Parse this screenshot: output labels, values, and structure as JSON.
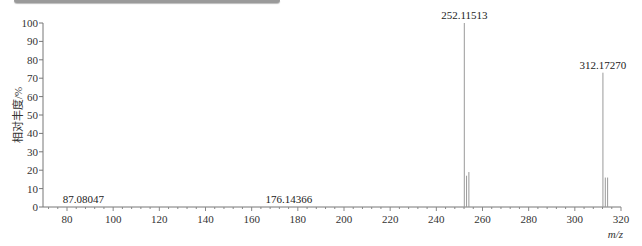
{
  "chart_data": {
    "type": "bar",
    "title": "",
    "xlabel": "m/z",
    "ylabel": "相对丰度/%",
    "xlim": [
      70,
      320
    ],
    "ylim": [
      0,
      100
    ],
    "x_ticks": [
      80,
      100,
      120,
      140,
      160,
      180,
      200,
      220,
      240,
      260,
      280,
      300,
      320
    ],
    "y_ticks": [
      0,
      10,
      20,
      30,
      40,
      50,
      60,
      70,
      80,
      90,
      100
    ],
    "grid": false,
    "peaks": [
      {
        "mz": 87.08047,
        "intensity": 0.3,
        "label": "87.08047"
      },
      {
        "mz": 176.14366,
        "intensity": 0.3,
        "label": "176.14366"
      },
      {
        "mz": 252.11513,
        "intensity": 100,
        "label": "252.11513"
      },
      {
        "mz": 253.1,
        "intensity": 17,
        "label": ""
      },
      {
        "mz": 254.1,
        "intensity": 19,
        "label": ""
      },
      {
        "mz": 312.1727,
        "intensity": 73,
        "label": "312.17270"
      },
      {
        "mz": 313.2,
        "intensity": 16,
        "label": ""
      },
      {
        "mz": 314.2,
        "intensity": 16,
        "label": ""
      }
    ]
  }
}
